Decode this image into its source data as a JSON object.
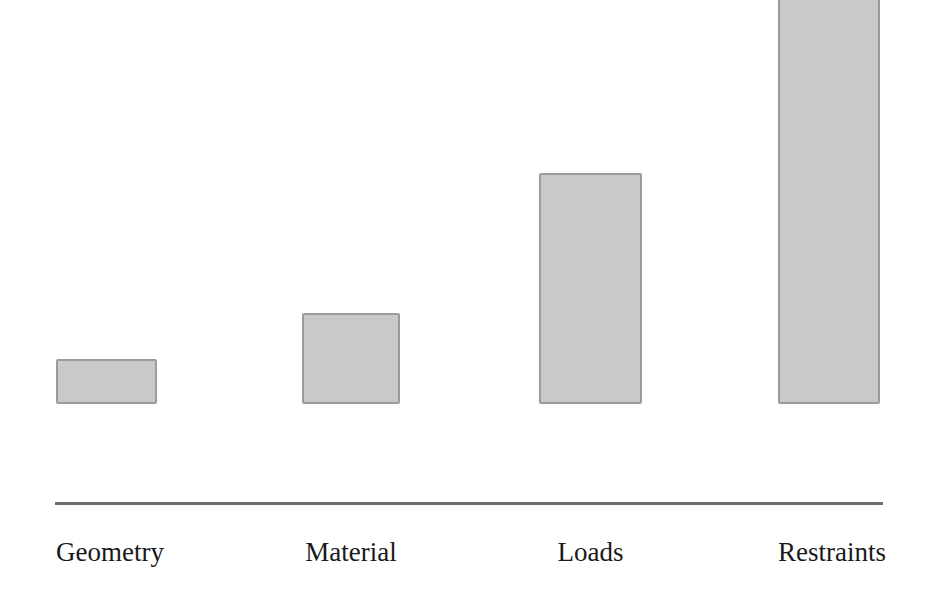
{
  "chart_data": {
    "type": "bar",
    "title": "",
    "subtitle": "",
    "xlabel": "",
    "ylabel": "",
    "categories": [
      "Geometry",
      "Material",
      "Loads",
      "Restraints"
    ],
    "values": [
      10,
      20,
      50,
      100
    ],
    "ylim": [
      0,
      100
    ],
    "grid": false,
    "legend": null,
    "axis": {
      "x_axis_visible": true,
      "y_axis_visible": false,
      "tick_labels_y": []
    },
    "style": {
      "bar_fill": "#c9c9c9",
      "bar_border": "#9b9b9b",
      "axis_color": "#6e6e6e",
      "label_color": "#1a1a1a",
      "background": "#ffffff"
    },
    "bars": [
      {
        "label": "Geometry",
        "value": 10,
        "height_px": 45,
        "left_px": 56,
        "width_px": 101
      },
      {
        "label": "Material",
        "value": 20,
        "height_px": 91,
        "left_px": 302,
        "width_px": 98
      },
      {
        "label": "Loads",
        "value": 50,
        "height_px": 231,
        "left_px": 539,
        "width_px": 103
      },
      {
        "label": "Restraints",
        "value": 100,
        "height_px": 461,
        "left_px": 778,
        "width_px": 102
      }
    ]
  }
}
